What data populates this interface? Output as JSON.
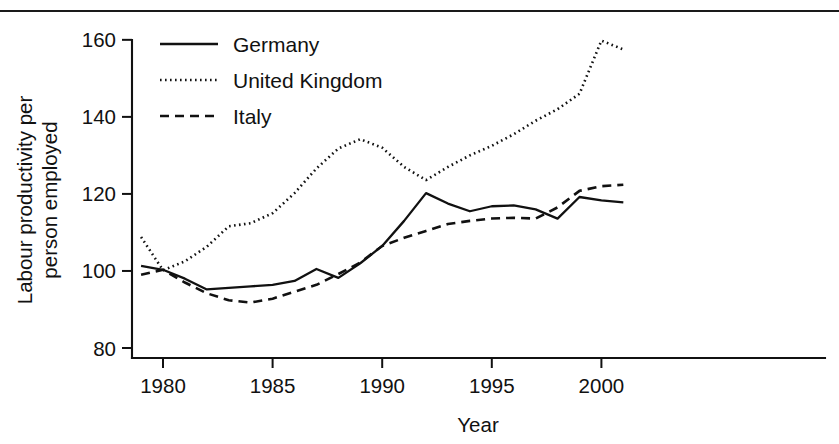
{
  "figure": {
    "background_color": "#ffffff",
    "ink_color": "#111111",
    "top_rule": true
  },
  "chart_data": {
    "type": "line",
    "title": "",
    "subtitle": "",
    "xlabel": "Year",
    "ylabel_line1": "Labour productivity per",
    "ylabel_line2": "person employed",
    "ylabel": "Labour productivity per person employed",
    "grid": false,
    "legend_position": "top-left inside plot",
    "xlim": [
      1978.6,
      2001.4
    ],
    "ylim": [
      78,
      163
    ],
    "xticks": [
      1980,
      1985,
      1990,
      1995,
      2000
    ],
    "xtick_labels": [
      "1980",
      "1985",
      "1990",
      "1995",
      "2000"
    ],
    "yticks": [
      80,
      100,
      120,
      140,
      160
    ],
    "ytick_labels": [
      "80",
      "100",
      "120",
      "140",
      "160"
    ],
    "x": [
      1979,
      1980,
      1981,
      1982,
      1983,
      1984,
      1985,
      1986,
      1987,
      1988,
      1989,
      1990,
      1991,
      1992,
      1993,
      1994,
      1995,
      1996,
      1997,
      1998,
      1999,
      2000,
      2001
    ],
    "series": [
      {
        "name": "Germany",
        "style": "solid",
        "color": "#111111",
        "values": [
          101.3,
          100.3,
          98.0,
          95.2,
          95.6,
          96.0,
          96.4,
          97.4,
          100.5,
          98.2,
          102.0,
          106.5,
          113.0,
          120.2,
          117.5,
          115.5,
          116.8,
          117.0,
          116.0,
          113.6,
          119.2,
          118.3,
          117.8
        ]
      },
      {
        "name": "United Kingdom",
        "style": "dotted",
        "color": "#111111",
        "values": [
          108.8,
          100.2,
          102.5,
          106.3,
          111.6,
          112.4,
          115.0,
          120.2,
          126.6,
          131.8,
          134.2,
          132.0,
          127.0,
          123.6,
          127.0,
          130.0,
          132.5,
          135.5,
          139.0,
          142.0,
          146.0,
          159.8,
          157.5
        ]
      },
      {
        "name": "Italy",
        "style": "dashed",
        "color": "#111111",
        "values": [
          99.0,
          100.3,
          97.0,
          94.2,
          92.4,
          91.8,
          92.8,
          94.6,
          96.4,
          99.2,
          102.2,
          106.5,
          108.6,
          110.4,
          112.2,
          113.0,
          113.6,
          113.8,
          113.6,
          116.5,
          120.8,
          122.0,
          122.4
        ]
      }
    ]
  },
  "legend": {
    "entries": [
      {
        "label": "Germany",
        "style": "solid"
      },
      {
        "label": "United Kingdom",
        "style": "dotted"
      },
      {
        "label": "Italy",
        "style": "dashed"
      }
    ]
  }
}
